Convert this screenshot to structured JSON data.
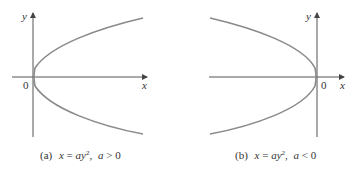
{
  "panels": [
    {
      "id": "a",
      "axis_labels": {
        "x": "x",
        "y": "y",
        "origin": "0"
      },
      "caption": {
        "prefix": "(a)",
        "equation_lhs": "x",
        "equals": " = ",
        "equation_rhs": "ay",
        "exponent": "2",
        "separator": ",",
        "condition_var": "a",
        "condition_op": " > 0"
      },
      "opening": "right"
    },
    {
      "id": "b",
      "axis_labels": {
        "x": "x",
        "y": "y",
        "origin": "0"
      },
      "caption": {
        "prefix": "(b)",
        "equation_lhs": "x",
        "equals": " = ",
        "equation_rhs": "ay",
        "exponent": "2",
        "separator": ",",
        "condition_var": "a",
        "condition_op": " < 0"
      },
      "opening": "left"
    }
  ],
  "colors": {
    "axis": "#555555",
    "curve": "#8a8a8a",
    "text": "#333333"
  }
}
